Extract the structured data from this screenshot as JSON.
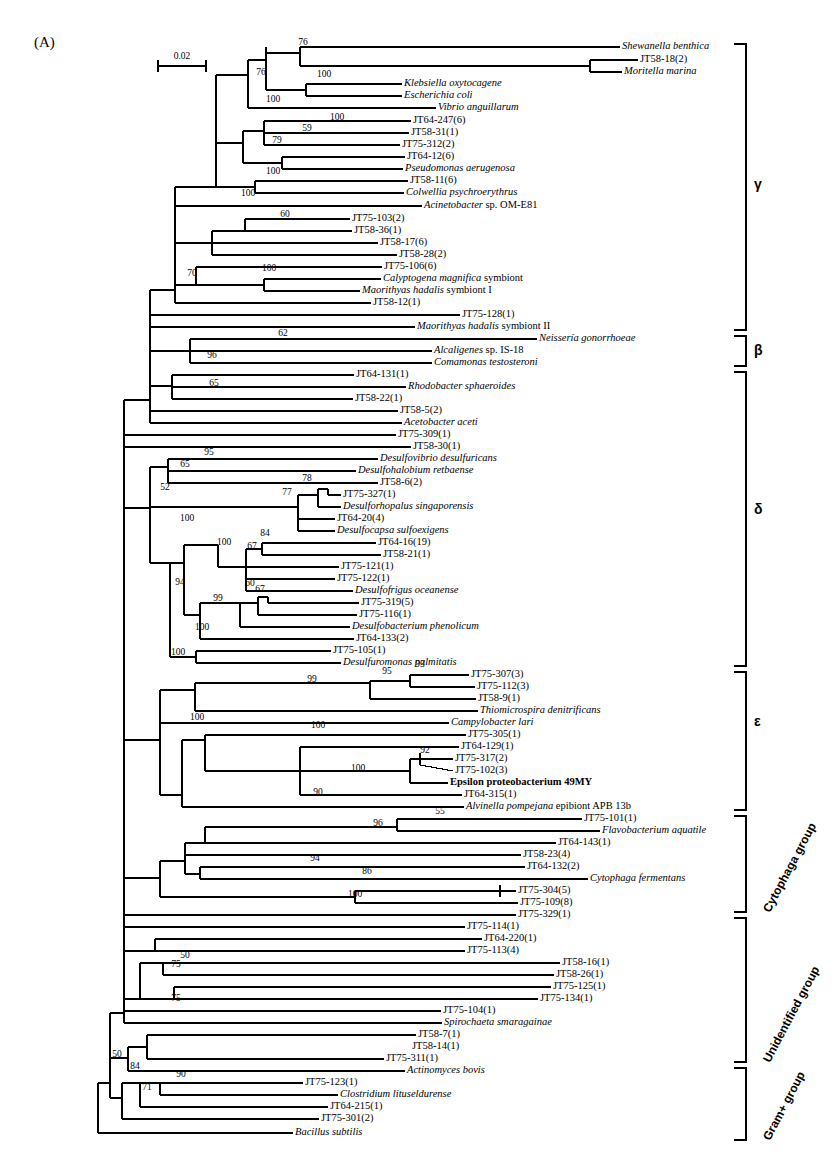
{
  "figure": {
    "panel_label": "(A)",
    "scale_bar": {
      "value": "0.02",
      "x1": 158,
      "x2": 206,
      "y": 66
    }
  },
  "chart_data": {
    "type": "tree",
    "title": "(A)",
    "scale": "0.02",
    "taxa_count": 86,
    "taxa": [
      {
        "label": "Shewanella benthica",
        "style": "italic",
        "x": 622,
        "y": 47,
        "tip": 620
      },
      {
        "label": "JT58-18(2)",
        "style": "roman",
        "x": 640,
        "y": 60,
        "tip": 638
      },
      {
        "label": "Moritella marina",
        "style": "italic",
        "x": 624,
        "y": 72,
        "tip": 622
      },
      {
        "label": "Klebsiella oxytocagene",
        "style": "italic",
        "x": 404,
        "y": 84,
        "tip": 402
      },
      {
        "label": "Escherichia coli",
        "style": "italic",
        "x": 404,
        "y": 96,
        "tip": 402
      },
      {
        "label": "Vibrio anguillarum",
        "style": "italic",
        "x": 438,
        "y": 108,
        "tip": 436
      },
      {
        "label": "JT64-247(6)",
        "style": "roman",
        "x": 413,
        "y": 121,
        "tip": 411
      },
      {
        "label": "JT58-31(1)",
        "style": "roman",
        "x": 411,
        "y": 133,
        "tip": 409
      },
      {
        "label": "JT75-312(2)",
        "style": "roman",
        "x": 402,
        "y": 145,
        "tip": 400
      },
      {
        "label": "JT64-12(6)",
        "style": "roman",
        "x": 407,
        "y": 157,
        "tip": 405
      },
      {
        "label": "Pseudomonas aerugenosa",
        "style": "italic",
        "x": 405,
        "y": 169,
        "tip": 403
      },
      {
        "label": "JT58-11(6)",
        "style": "roman",
        "x": 410,
        "y": 181,
        "tip": 408
      },
      {
        "label": "Colwellia psychroerythrus",
        "style": "italic",
        "x": 406,
        "y": 193,
        "tip": 404
      },
      {
        "label": "Acinetobacter sp. OM-E81",
        "style": "mixed",
        "x": 424,
        "y": 206,
        "tip": 422
      },
      {
        "label": "JT75-103(2)",
        "style": "roman",
        "x": 352,
        "y": 219,
        "tip": 350
      },
      {
        "label": "JT58-36(1)",
        "style": "roman",
        "x": 354,
        "y": 231,
        "tip": 352
      },
      {
        "label": "JT58-17(6)",
        "style": "roman",
        "x": 380,
        "y": 243,
        "tip": 378
      },
      {
        "label": "JT58-28(2)",
        "style": "roman",
        "x": 399,
        "y": 255,
        "tip": 397
      },
      {
        "label": "JT75-106(6)",
        "style": "roman",
        "x": 384,
        "y": 267,
        "tip": 382
      },
      {
        "label": "Calyptogena magnifica symbiont",
        "style": "mixed",
        "x": 383,
        "y": 279,
        "tip": 381
      },
      {
        "label": "Maorithyas hadalis symbiont I",
        "style": "mixed",
        "x": 362,
        "y": 291,
        "tip": 360
      },
      {
        "label": "JT58-12(1)",
        "style": "roman",
        "x": 373,
        "y": 303,
        "tip": 371
      },
      {
        "label": "JT75-128(1)",
        "style": "roman",
        "x": 462,
        "y": 315,
        "tip": 460
      },
      {
        "label": "Maorithyas hadalis symbiont II",
        "style": "mixed",
        "x": 417,
        "y": 327,
        "tip": 415
      },
      {
        "label": "Neissería gonorrhoeae",
        "style": "italic",
        "x": 539,
        "y": 339,
        "tip": 537
      },
      {
        "label": "Alcaligenes sp. IS-18",
        "style": "mixed",
        "x": 434,
        "y": 351,
        "tip": 432
      },
      {
        "label": "Comamonas testosteroni",
        "style": "italic",
        "x": 434,
        "y": 363,
        "tip": 432
      },
      {
        "label": "JT64-131(1)",
        "style": "roman",
        "x": 356,
        "y": 375,
        "tip": 354
      },
      {
        "label": "Rhodobacter sphaeroides",
        "style": "italic",
        "x": 408,
        "y": 387,
        "tip": 406
      },
      {
        "label": "JT58-22(1)",
        "style": "roman",
        "x": 355,
        "y": 399,
        "tip": 353
      },
      {
        "label": "JT58-5(2)",
        "style": "roman",
        "x": 400,
        "y": 411,
        "tip": 398
      },
      {
        "label": "Acetobacter aceti",
        "style": "italic",
        "x": 404,
        "y": 423,
        "tip": 402
      },
      {
        "label": "JT75-309(1)",
        "style": "roman",
        "x": 398,
        "y": 435,
        "tip": 396
      },
      {
        "label": "JT58-30(1)",
        "style": "roman",
        "x": 413,
        "y": 447,
        "tip": 411
      },
      {
        "label": "Desulfovibrio desulfuricans",
        "style": "italic",
        "x": 380,
        "y": 459,
        "tip": 378
      },
      {
        "label": "Desulfohalobium retbaense",
        "style": "italic",
        "x": 358,
        "y": 471,
        "tip": 356
      },
      {
        "label": "JT58-6(2)",
        "style": "roman",
        "x": 380,
        "y": 483,
        "tip": 378
      },
      {
        "label": "JT75-327(1)",
        "style": "roman",
        "x": 343,
        "y": 495,
        "tip": 341
      },
      {
        "label": "Desulforhopalus singaporensis",
        "style": "italic",
        "x": 343,
        "y": 507,
        "tip": 341
      },
      {
        "label": "JT64-20(4)",
        "style": "roman",
        "x": 337,
        "y": 519,
        "tip": 335
      },
      {
        "label": "Desulfocapsa sulfoexigens",
        "style": "italic",
        "x": 337,
        "y": 531,
        "tip": 335
      },
      {
        "label": "JT64-16(19)",
        "style": "roman",
        "x": 378,
        "y": 543,
        "tip": 376
      },
      {
        "label": "JT58-21(1)",
        "style": "roman",
        "x": 383,
        "y": 555,
        "tip": 381
      },
      {
        "label": "JT75-121(1)",
        "style": "roman",
        "x": 341,
        "y": 567,
        "tip": 339
      },
      {
        "label": "JT75-122(1)",
        "style": "roman",
        "x": 337,
        "y": 579,
        "tip": 335
      },
      {
        "label": "Desulfofrigus oceanense",
        "style": "italic",
        "x": 355,
        "y": 591,
        "tip": 353
      },
      {
        "label": "JT75-319(5)",
        "style": "roman",
        "x": 361,
        "y": 603,
        "tip": 359
      },
      {
        "label": "JT75-116(1)",
        "style": "roman",
        "x": 359,
        "y": 615,
        "tip": 357
      },
      {
        "label": "Desulfobacterium phenolicum",
        "style": "italic",
        "x": 352,
        "y": 627,
        "tip": 350
      },
      {
        "label": "JT64-133(2)",
        "style": "roman",
        "x": 356,
        "y": 639,
        "tip": 354
      },
      {
        "label": "JT75-105(1)",
        "style": "roman",
        "x": 333,
        "y": 651,
        "tip": 331
      },
      {
        "label": "Desulfuromonas palmitatis",
        "style": "italic",
        "x": 343,
        "y": 663,
        "tip": 341
      },
      {
        "label": "JT75-307(3)",
        "style": "roman",
        "x": 471,
        "y": 675,
        "tip": 469
      },
      {
        "label": "JT75-112(3)",
        "style": "roman",
        "x": 477,
        "y": 687,
        "tip": 475
      },
      {
        "label": "JT58-9(1)",
        "style": "roman",
        "x": 478,
        "y": 699,
        "tip": 476
      },
      {
        "label": "Thiomicrospira denitrificans",
        "style": "italic",
        "x": 480,
        "y": 711,
        "tip": 478
      },
      {
        "label": "Campylobacter lari",
        "style": "italic",
        "x": 451,
        "y": 723,
        "tip": 449
      },
      {
        "label": "JT75-305(1)",
        "style": "roman",
        "x": 468,
        "y": 735,
        "tip": 466
      },
      {
        "label": "JT64-129(1)",
        "style": "roman",
        "x": 461,
        "y": 747,
        "tip": 459
      },
      {
        "label": "JT75-317(2)",
        "style": "roman",
        "x": 455,
        "y": 759,
        "tip": 453
      },
      {
        "label": "JT75-102(3)",
        "style": "roman",
        "x": 455,
        "y": 771,
        "tip": 453
      },
      {
        "label": "Epsilon proteobacterium 49MY",
        "style": "bold",
        "x": 450,
        "y": 783,
        "tip": 448
      },
      {
        "label": "JT64-315(1)",
        "style": "roman",
        "x": 464,
        "y": 795,
        "tip": 462
      },
      {
        "label": "Alvinella pompejana epibiont APB 13b",
        "style": "mixed",
        "x": 466,
        "y": 807,
        "tip": 464
      },
      {
        "label": "JT75-101(1)",
        "style": "roman",
        "x": 584,
        "y": 819,
        "tip": 582
      },
      {
        "label": "Flavobacterium aquatile",
        "style": "italic",
        "x": 602,
        "y": 831,
        "tip": 600
      },
      {
        "label": "JT64-143(1)",
        "style": "roman",
        "x": 558,
        "y": 843,
        "tip": 556
      },
      {
        "label": "JT58-23(4)",
        "style": "roman",
        "x": 523,
        "y": 855,
        "tip": 521
      },
      {
        "label": "JT64-132(2)",
        "style": "roman",
        "x": 527,
        "y": 867,
        "tip": 525
      },
      {
        "label": "Cytophaga fermentans",
        "style": "italic",
        "x": 590,
        "y": 879,
        "tip": 588
      },
      {
        "label": "JT75-304(5)",
        "style": "roman",
        "x": 518,
        "y": 891,
        "tip": 516
      },
      {
        "label": "JT75-109(8)",
        "style": "roman",
        "x": 520,
        "y": 903,
        "tip": 518
      },
      {
        "label": "JT75-329(1)",
        "style": "roman",
        "x": 518,
        "y": 915,
        "tip": 516
      },
      {
        "label": "JT75-114(1)",
        "style": "roman",
        "x": 467,
        "y": 927,
        "tip": 465
      },
      {
        "label": "JT64-220(1)",
        "style": "roman",
        "x": 484,
        "y": 939,
        "tip": 482
      },
      {
        "label": "JT75-113(4)",
        "style": "roman",
        "x": 467,
        "y": 951,
        "tip": 465
      },
      {
        "label": "JT58-16(1)",
        "style": "roman",
        "x": 562,
        "y": 963,
        "tip": 560
      },
      {
        "label": "JT58-26(1)",
        "style": "roman",
        "x": 556,
        "y": 975,
        "tip": 554
      },
      {
        "label": "JT75-125(1)",
        "style": "roman",
        "x": 553,
        "y": 987,
        "tip": 551
      },
      {
        "label": "JT75-134(1)",
        "style": "roman",
        "x": 540,
        "y": 999,
        "tip": 538
      },
      {
        "label": "JT75-104(1)",
        "style": "roman",
        "x": 443,
        "y": 1011,
        "tip": 441
      },
      {
        "label": "Spirochaeta smaragainae",
        "style": "italic",
        "x": 444,
        "y": 1023,
        "tip": 442
      },
      {
        "label": "JT58-7(1)",
        "style": "roman",
        "x": 418,
        "y": 1035,
        "tip": 416
      },
      {
        "label": "JT58-14(1)",
        "style": "roman",
        "x": 412,
        "y": 1047,
        "tip": 410
      },
      {
        "label": "JT75-311(1)",
        "style": "roman",
        "x": 386,
        "y": 1059,
        "tip": 384
      },
      {
        "label": "Actinomyces bovis",
        "style": "italic",
        "x": 407,
        "y": 1071,
        "tip": 405
      },
      {
        "label": "JT75-123(1)",
        "style": "roman",
        "x": 305,
        "y": 1083,
        "tip": 303
      },
      {
        "label": "Clostridium lituseldurense",
        "style": "italic",
        "x": 340,
        "y": 1095,
        "tip": 338
      },
      {
        "label": "JT64-215(1)",
        "style": "roman",
        "x": 330,
        "y": 1107,
        "tip": 328
      },
      {
        "label": "JT75-301(2)",
        "style": "roman",
        "x": 321,
        "y": 1119,
        "tip": 319
      },
      {
        "label": "Bacillus subtilis",
        "style": "italic",
        "x": 295,
        "y": 1133,
        "tip": 293
      }
    ],
    "bootstrap_values": [
      {
        "value": "76",
        "x": 303,
        "y": 45
      },
      {
        "value": "100",
        "x": 324,
        "y": 77
      },
      {
        "value": "76",
        "x": 261,
        "y": 75
      },
      {
        "value": "100",
        "x": 273,
        "y": 102
      },
      {
        "value": "100",
        "x": 337,
        "y": 120
      },
      {
        "value": "59",
        "x": 307,
        "y": 131
      },
      {
        "value": "79",
        "x": 277,
        "y": 143
      },
      {
        "value": "100",
        "x": 273,
        "y": 174
      },
      {
        "value": "100",
        "x": 248,
        "y": 196
      },
      {
        "value": "60",
        "x": 285,
        "y": 217
      },
      {
        "value": "100",
        "x": 269,
        "y": 271
      },
      {
        "value": "70",
        "x": 192,
        "y": 276
      },
      {
        "value": "62",
        "x": 283,
        "y": 336
      },
      {
        "value": "96",
        "x": 212,
        "y": 358
      },
      {
        "value": "65",
        "x": 214,
        "y": 386
      },
      {
        "value": "95",
        "x": 209,
        "y": 455
      },
      {
        "value": "65",
        "x": 185,
        "y": 467
      },
      {
        "value": "52",
        "x": 165,
        "y": 490
      },
      {
        "value": "78",
        "x": 307,
        "y": 481
      },
      {
        "value": "77",
        "x": 287,
        "y": 495
      },
      {
        "value": "100",
        "x": 187,
        "y": 521
      },
      {
        "value": "84",
        "x": 265,
        "y": 536
      },
      {
        "value": "67",
        "x": 252,
        "y": 549
      },
      {
        "value": "100",
        "x": 224,
        "y": 545
      },
      {
        "value": "60",
        "x": 250,
        "y": 586
      },
      {
        "value": "67",
        "x": 260,
        "y": 592
      },
      {
        "value": "99",
        "x": 218,
        "y": 601
      },
      {
        "value": "94",
        "x": 180,
        "y": 585
      },
      {
        "value": "100",
        "x": 202,
        "y": 630
      },
      {
        "value": "100",
        "x": 178,
        "y": 655
      },
      {
        "value": "93",
        "x": 420,
        "y": 667
      },
      {
        "value": "95",
        "x": 387,
        "y": 674
      },
      {
        "value": "99",
        "x": 312,
        "y": 682
      },
      {
        "value": "100",
        "x": 318,
        "y": 728
      },
      {
        "value": "92",
        "x": 425,
        "y": 753
      },
      {
        "value": "100",
        "x": 358,
        "y": 771
      },
      {
        "value": "100",
        "x": 197,
        "y": 720
      },
      {
        "value": "90",
        "x": 318,
        "y": 795
      },
      {
        "value": "55",
        "x": 440,
        "y": 814
      },
      {
        "value": "96",
        "x": 378,
        "y": 826
      },
      {
        "value": "94",
        "x": 315,
        "y": 861
      },
      {
        "value": "86",
        "x": 367,
        "y": 874
      },
      {
        "value": "100",
        "x": 355,
        "y": 897
      },
      {
        "value": "50",
        "x": 185,
        "y": 958
      },
      {
        "value": "75",
        "x": 176,
        "y": 967
      },
      {
        "value": "75",
        "x": 176,
        "y": 1001
      },
      {
        "value": "50",
        "x": 117,
        "y": 1057
      },
      {
        "value": "84",
        "x": 135,
        "y": 1069
      },
      {
        "value": "90",
        "x": 181,
        "y": 1077
      },
      {
        "value": "71",
        "x": 147,
        "y": 1090
      }
    ],
    "group_brackets": [
      {
        "name": "gamma",
        "label": "γ",
        "x": 746,
        "y_top": 44,
        "y_bottom": 330,
        "label_y": 185,
        "orientation": "horizontal"
      },
      {
        "name": "beta",
        "label": "β",
        "x": 746,
        "y_top": 336,
        "y_bottom": 366,
        "label_y": 351,
        "orientation": "horizontal"
      },
      {
        "name": "delta",
        "label": "δ",
        "x": 746,
        "y_top": 372,
        "y_bottom": 666,
        "label_y": 510,
        "orientation": "horizontal"
      },
      {
        "name": "epsilon",
        "label": "ε",
        "x": 746,
        "y_top": 672,
        "y_bottom": 810,
        "label_y": 722,
        "orientation": "horizontal"
      },
      {
        "name": "cytophaga",
        "label": "Cytophaga group",
        "x": 746,
        "y_top": 816,
        "y_bottom": 912,
        "label_y": 864,
        "orientation": "rotated"
      },
      {
        "name": "unidentified",
        "label": "Unidentified group",
        "x": 746,
        "y_top": 918,
        "y_bottom": 1062,
        "label_y": 990,
        "orientation": "rotated"
      },
      {
        "name": "grampos",
        "label": "Gram+ group",
        "x": 746,
        "y_top": 1068,
        "y_bottom": 1140,
        "label_y": 1104,
        "orientation": "rotated"
      }
    ]
  }
}
